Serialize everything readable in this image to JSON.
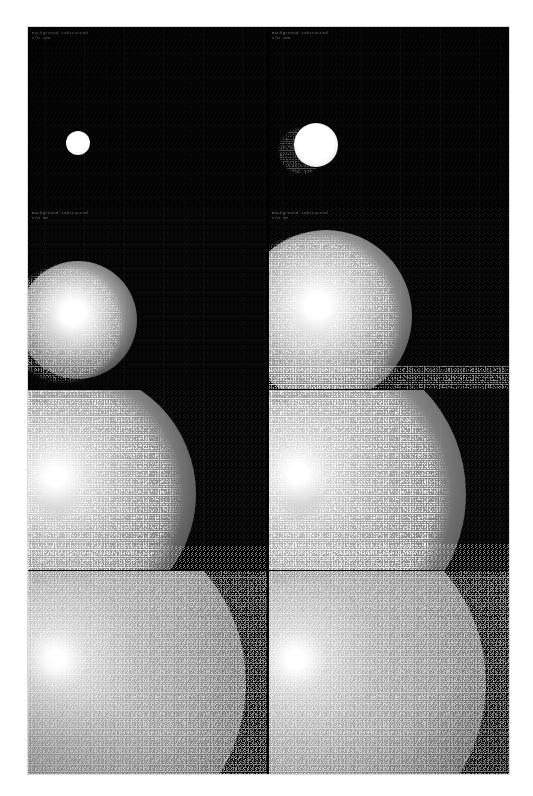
{
  "figure": {
    "kind": "scanned-grayscale-image-grid",
    "caption_visible": false,
    "background_color": "#ffffff",
    "plate_color": "#000000",
    "rows": 4,
    "columns": 2,
    "plate": {
      "x": 28,
      "y": 27,
      "width": 481,
      "height": 747
    }
  },
  "panels": [
    {
      "id": "panel-r1c1",
      "row": 1,
      "column": 1,
      "label_line1": "Background subtracted",
      "label_line2": "S/N  100",
      "source": {
        "center_x_pct": 21,
        "center_y_pct": 65,
        "radius_pct": 10,
        "peak_brightness": 255,
        "halo_brightness": 60
      },
      "noise_level": 0.04,
      "noise_seed": 1,
      "filled_fraction": 0.0
    },
    {
      "id": "panel-r1c2",
      "row": 1,
      "column": 2,
      "label_line1": "Background subtracted",
      "label_line2": "S/N  100",
      "source": {
        "center_x_pct": 22,
        "center_y_pct": 66,
        "radius_pct": 18,
        "peak_brightness": 255,
        "halo_brightness": 70
      },
      "noise_level": 0.05,
      "noise_seed": 2,
      "filled_fraction": 0.0
    },
    {
      "id": "panel-r2c1",
      "row": 2,
      "column": 1,
      "label_line1": "Background subtracted",
      "label_line2": "S/N  30",
      "source": {
        "center_x_pct": 21,
        "center_y_pct": 62,
        "radius_pct": 27,
        "peak_brightness": 255,
        "halo_brightness": 120
      },
      "noise_level": 0.22,
      "noise_seed": 3,
      "filled_fraction": 0.0
    },
    {
      "id": "panel-r2c2",
      "row": 2,
      "column": 2,
      "label_line1": "Background subtracted",
      "label_line2": "S/N  30",
      "source": {
        "center_x_pct": 24,
        "center_y_pct": 60,
        "radius_pct": 40,
        "peak_brightness": 255,
        "halo_brightness": 140
      },
      "noise_level": 0.3,
      "noise_seed": 4,
      "filled_fraction": 0.15
    },
    {
      "id": "panel-r3c1",
      "row": 3,
      "column": 1,
      "label_line1": "Background subtracted",
      "label_line2": "S/N  10",
      "source": {
        "center_x_pct": 18,
        "center_y_pct": 58,
        "radius_pct": 55,
        "peak_brightness": 255,
        "halo_brightness": 165
      },
      "noise_level": 0.52,
      "noise_seed": 5,
      "filled_fraction": 0.3
    },
    {
      "id": "panel-r3c2",
      "row": 3,
      "column": 2,
      "label_line1": "Background subtracted",
      "label_line2": "S/N  10",
      "source": {
        "center_x_pct": 20,
        "center_y_pct": 58,
        "radius_pct": 70,
        "peak_brightness": 255,
        "halo_brightness": 175
      },
      "noise_level": 0.6,
      "noise_seed": 6,
      "filled_fraction": 0.45
    },
    {
      "id": "panel-r4c1",
      "row": 4,
      "column": 1,
      "label_line1": "Background subtracted",
      "label_line2": "S/N  3",
      "source": {
        "center_x_pct": 20,
        "center_y_pct": 55,
        "radius_pct": 95,
        "peak_brightness": 255,
        "halo_brightness": 190
      },
      "noise_level": 0.8,
      "noise_seed": 7,
      "filled_fraction": 0.85
    },
    {
      "id": "panel-r4c2",
      "row": 4,
      "column": 2,
      "label_line1": "Background subtracted",
      "label_line2": "S/N  3",
      "source": {
        "center_x_pct": 20,
        "center_y_pct": 55,
        "radius_pct": 95,
        "peak_brightness": 255,
        "halo_brightness": 190
      },
      "noise_level": 0.84,
      "noise_seed": 8,
      "filled_fraction": 0.9
    }
  ],
  "colors": {
    "page": "#ffffff",
    "plate": "#000000",
    "label_text": "#b9b9b9",
    "source_peak": "#ffffff",
    "grain_high": "#e8e8e8",
    "grain_low": "#0a0a0a"
  }
}
